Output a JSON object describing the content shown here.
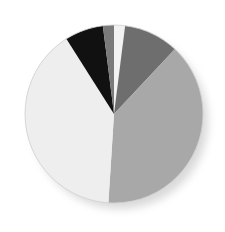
{
  "figure": {
    "background_color": "#ffffff",
    "width": 225,
    "height": 232
  },
  "chart_data": {
    "type": "pie",
    "title": "",
    "xlabel": "",
    "ylabel": "",
    "legend": "none",
    "grid": false,
    "start_angle_deg": 90,
    "direction": "clockwise",
    "center": [
      114,
      114
    ],
    "radius": 89,
    "categories": [
      "Segment 1",
      "Segment 2",
      "Segment 3",
      "Segment 4",
      "Segment 5",
      "Segment 6"
    ],
    "values": [
      2,
      10,
      39,
      40,
      7,
      2
    ],
    "percentages": [
      "2%",
      "10%",
      "39%",
      "40%",
      "7%",
      "2%"
    ],
    "colors": [
      "#f2f2f2",
      "#6e6e6e",
      "#a8a8a8",
      "#eeeeee",
      "#111111",
      "#7a7a7a"
    ],
    "slice_angles_deg": [
      7.2,
      36.0,
      140.4,
      144.0,
      25.2,
      7.2
    ],
    "annotations": []
  },
  "style": {
    "shadow_color": "#d8d8d8",
    "edge_color": "#c9c9c9",
    "background": "#ffffff"
  }
}
